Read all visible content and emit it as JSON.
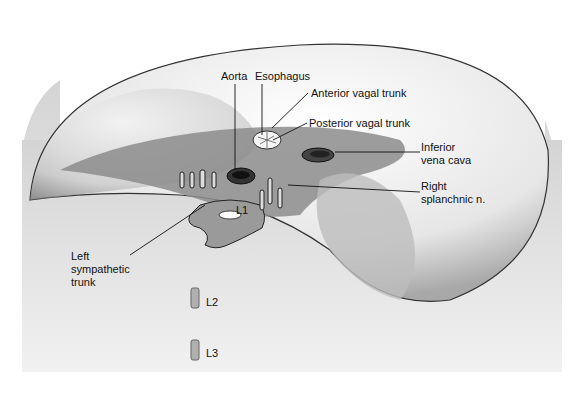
{
  "figure": {
    "labels": {
      "aorta": "Aorta",
      "esophagus": "Esophagus",
      "anterior_vagal_trunk": "Anterior vagal trunk",
      "posterior_vagal_trunk": "Posterior vagal trunk",
      "inferior_vena_cava_1": "Inferior",
      "inferior_vena_cava_2": "vena cava",
      "right_splanchnic_1": "Right",
      "right_splanchnic_2": "splanchnic n.",
      "left_sympathetic_1": "Left",
      "left_sympathetic_2": "sympathetic",
      "left_sympathetic_3": "trunk",
      "l1": "L1",
      "l2": "L2",
      "l3": "L3"
    },
    "colors": {
      "dome": "#e8e8e8",
      "shadow": "#8a8a8a",
      "line": "#222222",
      "vertebra": "#9a9a9a"
    }
  }
}
